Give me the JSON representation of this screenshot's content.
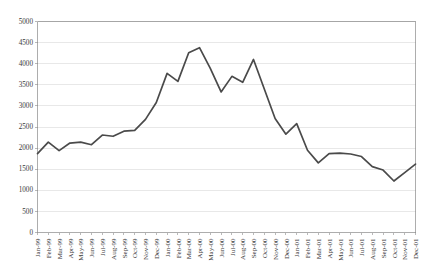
{
  "chart_data": {
    "type": "line",
    "title": "",
    "subtitle": "",
    "xlabel": "",
    "ylabel": "",
    "grid": true,
    "legend": false,
    "legend_position": "none",
    "line_color": "#4a4a4a",
    "ylim": [
      0,
      5000
    ],
    "ytick_step": 500,
    "ytick_labels": [
      "0",
      "500",
      "1000",
      "1500",
      "2000",
      "2500",
      "3000",
      "3500",
      "4000",
      "4500",
      "5000"
    ],
    "ytick_values": [
      0,
      500,
      1000,
      1500,
      2000,
      2500,
      3000,
      3500,
      4000,
      4500,
      5000
    ],
    "categories": [
      "Jan-99",
      "Feb-99",
      "Mar-99",
      "Apr-99",
      "May-99",
      "Jun-99",
      "Jul-99",
      "Aug-99",
      "Sep-99",
      "Oct-99",
      "Nov-99",
      "Dec-99",
      "Jan-00",
      "Feb-00",
      "Mar-00",
      "Apr-00",
      "May-00",
      "Jun-00",
      "Jul-00",
      "Aug-00",
      "Sep-00",
      "Oct-00",
      "Nov-00",
      "Dec-00",
      "Jan-01",
      "Feb-01",
      "Mar-01",
      "Apr-01",
      "May-01",
      "Jun-01",
      "Jul-01",
      "Aug-01",
      "Sep-01",
      "Oct-01",
      "Nov-01",
      "Dec-01"
    ],
    "series": [
      {
        "name": "",
        "values": [
          1870,
          2140,
          1940,
          2120,
          2140,
          2080,
          2310,
          2280,
          2400,
          2420,
          2680,
          3080,
          3770,
          3580,
          4260,
          4380,
          3890,
          3330,
          3700,
          3560,
          4100,
          3400,
          2700,
          2330,
          2580,
          1950,
          1650,
          1870,
          1880,
          1860,
          1800,
          1560,
          1480,
          1220,
          1420,
          1620
        ]
      }
    ]
  }
}
